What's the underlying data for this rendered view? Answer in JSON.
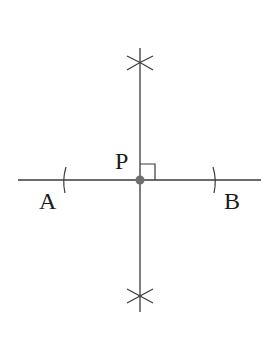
{
  "diagram": {
    "title": "",
    "colors": {
      "line": "#3a3a3a",
      "point": "#6e6e6e",
      "text": "#1a1a1a"
    },
    "labels": {
      "point_a": "A",
      "point_b": "B",
      "point_p": "P"
    },
    "elements": [
      {
        "type": "line",
        "name": "line-AB",
        "from": [
          18,
          180
        ],
        "to": [
          261,
          180
        ]
      },
      {
        "type": "line",
        "name": "perpendicular-line",
        "from": [
          140,
          48
        ],
        "to": [
          140,
          312
        ]
      },
      {
        "type": "arc",
        "name": "arc-near-A",
        "at": [
          64,
          180
        ]
      },
      {
        "type": "arc",
        "name": "arc-near-B",
        "at": [
          215,
          180
        ]
      },
      {
        "type": "cross-arcs",
        "name": "top-intersection",
        "at": [
          140,
          63
        ]
      },
      {
        "type": "cross-arcs",
        "name": "bottom-intersection",
        "at": [
          140,
          296
        ]
      },
      {
        "type": "point",
        "name": "point-P",
        "at": [
          140,
          180
        ]
      },
      {
        "type": "right-angle-marker",
        "name": "right-angle",
        "at": [
          140,
          180
        ],
        "size": 15
      }
    ]
  }
}
